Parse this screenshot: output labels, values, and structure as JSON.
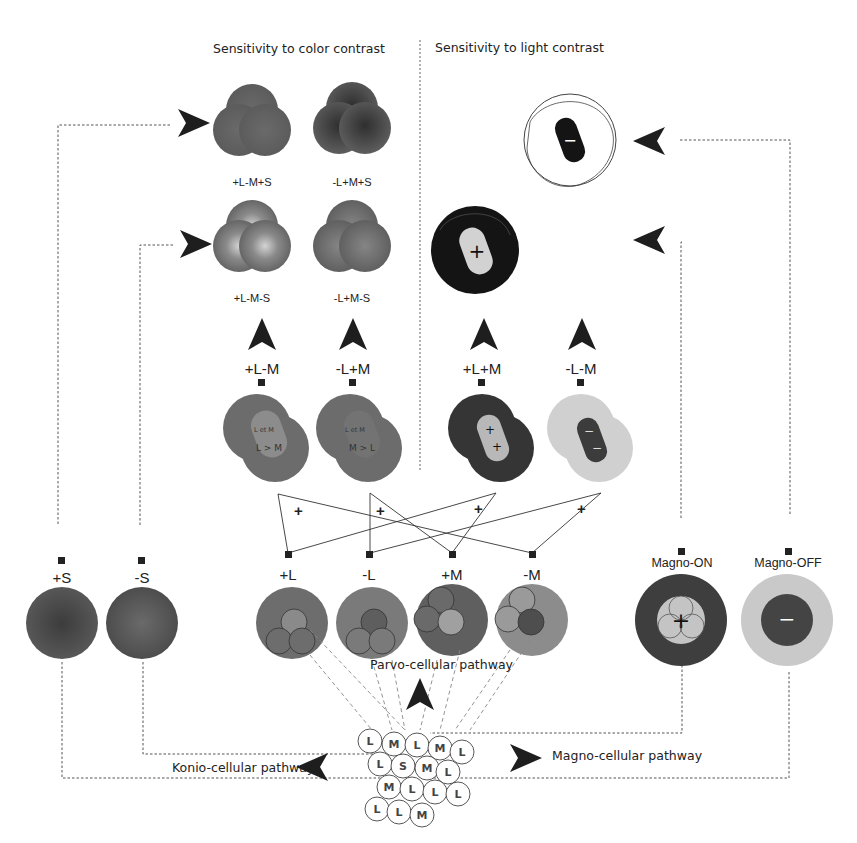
{
  "headers": {
    "color": "Sensitivity to color contrast",
    "light": "Sensitivity to light contrast"
  },
  "color_contrast_cells": [
    {
      "label": "+L-M+S"
    },
    {
      "label": "-L+M+S"
    },
    {
      "label": "+L-M-S"
    },
    {
      "label": "-L+M-S"
    }
  ],
  "light_contrast_cells": [
    {
      "sign": "−",
      "type": "off-center"
    },
    {
      "sign": "+",
      "type": "on-center"
    }
  ],
  "opponent_cells": [
    {
      "label": "+L-M",
      "inner_top": "L et M",
      "inner_bottom": "L > M"
    },
    {
      "label": "-L+M",
      "inner_top": "L et M",
      "inner_bottom": "M > L"
    },
    {
      "label": "+L+M",
      "signs": [
        "+",
        "+"
      ]
    },
    {
      "label": "-L-M",
      "signs": [
        "−",
        "−"
      ]
    }
  ],
  "wiring_signs": [
    "+",
    "+",
    "+",
    "+"
  ],
  "parvo_cells": [
    {
      "label": "+L"
    },
    {
      "label": "-L"
    },
    {
      "label": "+M"
    },
    {
      "label": "-M"
    }
  ],
  "konio_cells": [
    {
      "label": "+S"
    },
    {
      "label": "-S"
    }
  ],
  "magno_cells": [
    {
      "label": "Magno-ON",
      "sign": "+"
    },
    {
      "label": "Magno-OFF",
      "sign": "−"
    }
  ],
  "pathways": {
    "parvo": "Parvo-cellular pathway",
    "konio": "Konio-cellular pathway",
    "magno": "Magno-cellular pathway"
  },
  "cone_mosaic": {
    "rows": [
      [
        "L",
        "M",
        "L",
        "M",
        "L"
      ],
      [
        "L",
        "S",
        "M",
        "L"
      ],
      [
        "M",
        "L",
        "L",
        "L"
      ],
      [
        "L",
        "L",
        "M"
      ]
    ]
  },
  "colors": {
    "mid_gray": "#6e6e6e",
    "dark_gray": "#3a3a3a",
    "light_gray": "#c8c8c8",
    "black": "#141414",
    "arrow": "#1e1e1e"
  }
}
